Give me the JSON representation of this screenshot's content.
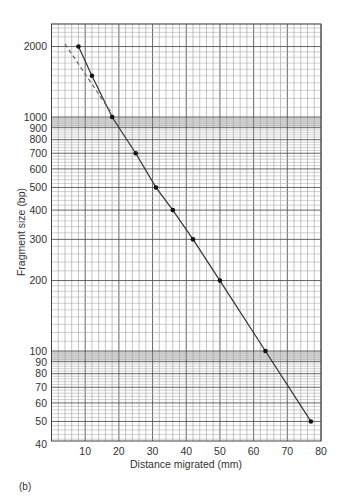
{
  "chart_data": {
    "type": "line",
    "title": "",
    "xlabel": "Distance migrated (mm)",
    "ylabel": "Fragment size (bp)",
    "xlim": [
      0,
      80
    ],
    "ylim": [
      40,
      2500
    ],
    "yscale": "log",
    "grid": true,
    "x_ticks": [
      10,
      20,
      30,
      40,
      50,
      60,
      70,
      80
    ],
    "y_ticks": [
      40,
      50,
      60,
      70,
      80,
      90,
      100,
      200,
      300,
      400,
      500,
      600,
      700,
      800,
      900,
      1000,
      2000
    ],
    "series": [
      {
        "name": "Standard curve (measured)",
        "style": "solid",
        "markers": true,
        "points": [
          {
            "x": 8,
            "y": 2000
          },
          {
            "x": 12,
            "y": 1500
          },
          {
            "x": 18,
            "y": 1000
          },
          {
            "x": 25,
            "y": 700
          },
          {
            "x": 31,
            "y": 500
          },
          {
            "x": 36,
            "y": 400
          },
          {
            "x": 42,
            "y": 300
          },
          {
            "x": 50,
            "y": 200
          },
          {
            "x": 63.5,
            "y": 100
          },
          {
            "x": 77,
            "y": 50
          }
        ]
      },
      {
        "name": "Linear extrapolation",
        "style": "dashed",
        "markers": false,
        "points": [
          {
            "x": 4,
            "y": 2050
          },
          {
            "x": 18,
            "y": 1030
          }
        ]
      }
    ],
    "shaded_bands": [
      [
        900,
        1000
      ],
      [
        90,
        100
      ]
    ]
  },
  "labels": {
    "xlabel": "Distance migrated (mm)",
    "ylabel": "Fragment size (bp)",
    "panel": "(b)"
  }
}
